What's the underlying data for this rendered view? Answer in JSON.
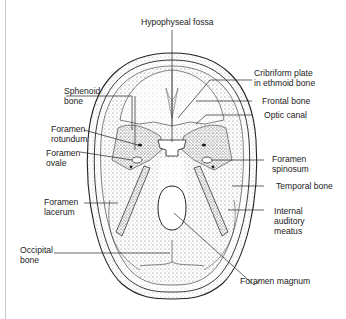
{
  "figure": {
    "type": "anatomical-diagram",
    "colors": {
      "line": "#222222",
      "stipple": "#555555",
      "background": "#ffffff",
      "frame": "#c8c8c8"
    }
  },
  "labels": {
    "hypophyseal_fossa": {
      "lines": [
        "Hypophyseal fossa"
      ]
    },
    "cribriform_plate": {
      "lines": [
        "Cribriform plate",
        "in ethmoid bone"
      ]
    },
    "sphenoid_bone": {
      "lines": [
        "Sphenoid",
        "bone"
      ]
    },
    "frontal_bone": {
      "lines": [
        "Frontal bone"
      ]
    },
    "optic_canal": {
      "lines": [
        "Optic canal"
      ]
    },
    "foramen_rotundum": {
      "lines": [
        "Foramen",
        "rotundum"
      ]
    },
    "foramen_ovale": {
      "lines": [
        "Foramen",
        "ovale"
      ]
    },
    "foramen_spinosum": {
      "lines": [
        "Foramen",
        "spinosum"
      ]
    },
    "temporal_bone": {
      "lines": [
        "Temporal bone"
      ]
    },
    "foramen_lacerum": {
      "lines": [
        "Foramen",
        "lacerum"
      ]
    },
    "internal_auditory_meatus": {
      "lines": [
        "Internal",
        "auditory",
        "meatus"
      ]
    },
    "occipital_bone": {
      "lines": [
        "Occipital",
        "bone"
      ]
    },
    "foramen_magnum": {
      "lines": [
        "Foramen magnum"
      ]
    }
  }
}
